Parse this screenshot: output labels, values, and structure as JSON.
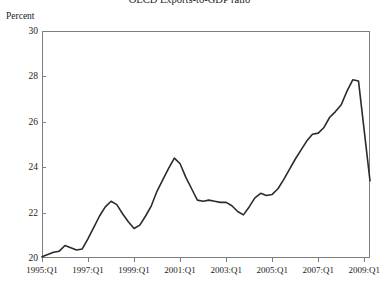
{
  "chart_data": {
    "type": "line",
    "title": "OECD Exports-to-GDP ratio",
    "subtitle": "",
    "xlabel": "",
    "ylabel": "Percent",
    "ylim": [
      20,
      30
    ],
    "xlim": [
      "1995:Q1",
      "2009:Q2"
    ],
    "grid": false,
    "legend": null,
    "y_ticks": [
      30,
      28,
      26,
      24,
      22,
      20
    ],
    "y_tick_labels": [
      "30",
      "28",
      "26",
      "24",
      "22",
      "20"
    ],
    "x_ticks": [
      "1995:Q1",
      "1997:Q1",
      "1999:Q1",
      "2001:Q1",
      "2003:Q1",
      "2005:Q1",
      "2007:Q1",
      "2009:Q1"
    ],
    "line_color": "#2b2b2b",
    "line_width": 1.6,
    "axis_color": "#7d7d7d",
    "background": "#ffffff",
    "series": [
      {
        "name": "OECD Exports-to-GDP ratio",
        "x": [
          "1995:Q1",
          "1995:Q2",
          "1995:Q3",
          "1995:Q4",
          "1996:Q1",
          "1996:Q2",
          "1996:Q3",
          "1996:Q4",
          "1997:Q1",
          "1997:Q2",
          "1997:Q3",
          "1997:Q4",
          "1998:Q1",
          "1998:Q2",
          "1998:Q3",
          "1998:Q4",
          "1999:Q1",
          "1999:Q2",
          "1999:Q3",
          "1999:Q4",
          "2000:Q1",
          "2000:Q2",
          "2000:Q3",
          "2000:Q4",
          "2001:Q1",
          "2001:Q2",
          "2001:Q3",
          "2001:Q4",
          "2002:Q1",
          "2002:Q2",
          "2002:Q3",
          "2002:Q4",
          "2003:Q1",
          "2003:Q2",
          "2003:Q3",
          "2003:Q4",
          "2004:Q1",
          "2004:Q2",
          "2004:Q3",
          "2004:Q4",
          "2005:Q1",
          "2005:Q2",
          "2005:Q3",
          "2005:Q4",
          "2006:Q1",
          "2006:Q2",
          "2006:Q3",
          "2006:Q4",
          "2007:Q1",
          "2007:Q2",
          "2007:Q3",
          "2007:Q4",
          "2008:Q1",
          "2008:Q2",
          "2008:Q3",
          "2008:Q4",
          "2009:Q1",
          "2009:Q2"
        ],
        "values": [
          20.05,
          20.15,
          20.25,
          20.3,
          20.55,
          20.45,
          20.35,
          20.4,
          20.85,
          21.35,
          21.85,
          22.25,
          22.5,
          22.35,
          21.95,
          21.6,
          21.3,
          21.45,
          21.85,
          22.3,
          22.95,
          23.45,
          23.95,
          24.4,
          24.15,
          23.55,
          23.05,
          22.55,
          22.5,
          22.55,
          22.5,
          22.45,
          22.45,
          22.3,
          22.05,
          21.9,
          22.25,
          22.65,
          22.85,
          22.75,
          22.8,
          23.05,
          23.45,
          23.9,
          24.35,
          24.75,
          25.15,
          25.45,
          25.5,
          25.75,
          26.2,
          26.45,
          26.75,
          27.35,
          27.85,
          27.8,
          25.6,
          23.4
        ]
      }
    ]
  },
  "axis": {
    "y_unit_label": "Percent"
  }
}
